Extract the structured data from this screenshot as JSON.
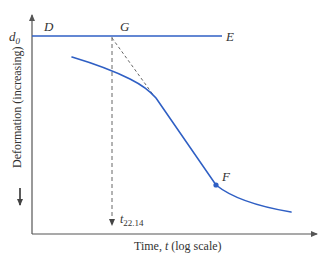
{
  "figure": {
    "colors": {
      "curve": "#2f5fc4",
      "axes": "#555555",
      "dashed": "#666666",
      "text": "#333333"
    },
    "labels": {
      "d0": "d",
      "d0_sub": "0",
      "D": "D",
      "G": "G",
      "E": "E",
      "F": "F",
      "t": "t",
      "t_sub": "22.14",
      "y_axis": "Deformation (increasing)",
      "x_axis_prefix": "Time, ",
      "x_axis_var": "t",
      "x_axis_suffix": " (log scale)"
    },
    "points": {
      "d0_line_y": 36,
      "D": [
        48,
        30
      ],
      "G": [
        125,
        30
      ],
      "E": [
        228,
        40
      ],
      "F_point": [
        216,
        185
      ],
      "tangent_start": [
        112,
        38
      ],
      "tangent_end": [
        152,
        94
      ],
      "t_marker_x": 112
    }
  }
}
